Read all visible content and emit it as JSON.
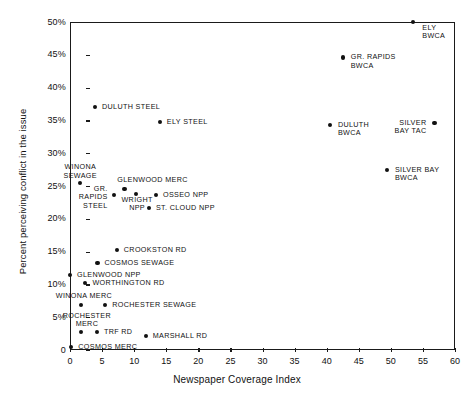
{
  "chart_data": {
    "type": "scatter",
    "title": "",
    "xlabel": "Newspaper Coverage Index",
    "ylabel": "Percent perceiving conflict in the issue",
    "xlim": [
      0,
      60
    ],
    "ylim": [
      0,
      50
    ],
    "grid": false,
    "legend": "none",
    "xticks": [
      "0",
      "5",
      "10",
      "15",
      "20",
      "25",
      "30",
      "35",
      "40",
      "45",
      "50",
      "55",
      "60"
    ],
    "xtick_values": [
      0,
      5,
      10,
      15,
      20,
      25,
      30,
      35,
      40,
      45,
      50,
      55,
      60
    ],
    "yticks": [
      "0",
      "5%",
      "10%",
      "15%",
      "20%",
      "25%",
      "30%",
      "35%",
      "40%",
      "45%",
      "50%"
    ],
    "ytick_values": [
      0,
      5,
      10,
      15,
      20,
      25,
      30,
      35,
      40,
      45,
      50
    ],
    "point_color": "#111111",
    "axis_color": "#1a1a1a",
    "points": [
      {
        "label": "ELY\nBWCA",
        "x": 53.5,
        "y": 50.0,
        "anchor": "lr",
        "dx": 9,
        "dy": 2
      },
      {
        "label": "GR. RAPIDS\nBWCA",
        "x": 42.5,
        "y": 44.6,
        "anchor": "lr",
        "dx": 8,
        "dy": -4
      },
      {
        "label": "DULUTH STEEL",
        "x": 3.9,
        "y": 37.1,
        "anchor": "lr",
        "dx": 7,
        "dy": -4
      },
      {
        "label": "ELY STEEL",
        "x": 14.0,
        "y": 34.8,
        "anchor": "lr",
        "dx": 7,
        "dy": -4
      },
      {
        "label": "DULUTH\nBWCA",
        "x": 40.5,
        "y": 34.3,
        "anchor": "lr",
        "dx": 8,
        "dy": -4
      },
      {
        "label": "SILVER\nBAY TAC",
        "x": 56.8,
        "y": 34.6,
        "anchor": "rl",
        "dx": -8,
        "dy": -4
      },
      {
        "label": "SILVER BAY\nBWCA",
        "x": 49.4,
        "y": 27.4,
        "anchor": "lr",
        "dx": 8,
        "dy": -4
      },
      {
        "label": "WINONA\nSEWAGE",
        "x": 1.6,
        "y": 25.4,
        "anchor": "ct",
        "dx": 0,
        "dy": -20
      },
      {
        "label": "GLENWOOD MERC",
        "x": 8.5,
        "y": 24.6,
        "anchor": "ct",
        "dx": 28,
        "dy": -13
      },
      {
        "label": "GR.\nRAPIDS\nSTEEL",
        "x": 6.8,
        "y": 23.6,
        "anchor": "rl",
        "dx": -6,
        "dy": -10
      },
      {
        "label": "WRIGHT\nNPP",
        "x": 10.3,
        "y": 23.8,
        "anchor": "ct",
        "dx": 1,
        "dy": 2
      },
      {
        "label": "OSSEO NPP",
        "x": 13.4,
        "y": 23.6,
        "anchor": "lr",
        "dx": 7,
        "dy": -4
      },
      {
        "label": "ST. CLOUD NPP",
        "x": 12.3,
        "y": 21.7,
        "anchor": "lr",
        "dx": 7,
        "dy": -4
      },
      {
        "label": "CROOKSTON RD",
        "x": 7.3,
        "y": 15.3,
        "anchor": "lr",
        "dx": 7,
        "dy": -4
      },
      {
        "label": "COSMOS SEWAGE",
        "x": 4.3,
        "y": 13.3,
        "anchor": "lr",
        "dx": 7,
        "dy": -4
      },
      {
        "label": "GLENWOOD NPP",
        "x": 0.0,
        "y": 11.4,
        "anchor": "lr",
        "dx": 7,
        "dy": -4
      },
      {
        "label": "WORTHINGTON RD",
        "x": 2.4,
        "y": 10.2,
        "anchor": "lr",
        "dx": 7,
        "dy": -4
      },
      {
        "label": "WINONA MERC",
        "x": 1.7,
        "y": 6.8,
        "anchor": "ct",
        "dx": 3,
        "dy": -13
      },
      {
        "label": "ROCHESTER SEWAGE",
        "x": 5.5,
        "y": 6.9,
        "anchor": "lr",
        "dx": 7,
        "dy": -4
      },
      {
        "label": "ROCHESTER\nMERC",
        "x": 1.7,
        "y": 2.8,
        "anchor": "ct",
        "dx": 6,
        "dy": -20
      },
      {
        "label": "TRF RD",
        "x": 4.2,
        "y": 2.8,
        "anchor": "lr",
        "dx": 7,
        "dy": -4
      },
      {
        "label": "MARSHALL RD",
        "x": 11.8,
        "y": 2.1,
        "anchor": "lr",
        "dx": 7,
        "dy": -4
      },
      {
        "label": "COSMOS MERC",
        "x": 0.2,
        "y": 0.5,
        "anchor": "lr",
        "dx": 7,
        "dy": -4
      }
    ]
  }
}
